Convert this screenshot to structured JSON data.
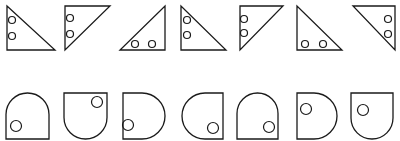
{
  "figure": {
    "stroke_color": "#1a1a1a",
    "background": "#ffffff"
  },
  "rows": [
    {
      "name": "triangles",
      "items": [
        {
          "points": "7,6 7,50 55,50",
          "circles": [
            [
              12,
              20
            ],
            [
              12,
              36
            ]
          ]
        },
        {
          "points": "65,6 110,6 65,50",
          "circles": [
            [
              70,
              18
            ],
            [
              70,
              34
            ]
          ]
        },
        {
          "points": "165,6 165,50 120,50",
          "circles": [
            [
              135,
              44
            ],
            [
              152,
              44
            ]
          ]
        },
        {
          "points": "181,6 181,50 226,50",
          "circles": [
            [
              187,
              20
            ],
            [
              187,
              35
            ]
          ]
        },
        {
          "points": "240,6 283,6 240,50",
          "circles": [
            [
              244,
              19
            ],
            [
              244,
              33
            ]
          ]
        },
        {
          "points": "297,6 297,50 342,50",
          "circles": [
            [
              305,
              44
            ],
            [
              323,
              44
            ]
          ]
        },
        {
          "points": "353,6 395,6 395,50",
          "circles": [
            [
              388,
              19
            ],
            [
              388,
              34
            ]
          ]
        }
      ],
      "circle_radius": 3.5
    },
    {
      "name": "d-shapes",
      "items": [
        {
          "orientation": "dome-top",
          "x": 6,
          "y": 93,
          "w": 43,
          "h": 46,
          "circle": [
            16,
            126
          ]
        },
        {
          "orientation": "dome-bottom",
          "x": 64,
          "y": 93,
          "w": 43,
          "h": 46,
          "circle": [
            97,
            102
          ]
        },
        {
          "orientation": "dome-right",
          "x": 123,
          "y": 93,
          "w": 42,
          "h": 46,
          "circle": [
            128,
            125
          ]
        },
        {
          "orientation": "dome-left",
          "x": 182,
          "y": 93,
          "w": 41,
          "h": 46,
          "circle": [
            213,
            128
          ]
        },
        {
          "orientation": "dome-top",
          "x": 237,
          "y": 93,
          "w": 41,
          "h": 46,
          "circle": [
            269,
            127
          ]
        },
        {
          "orientation": "dome-right",
          "x": 297,
          "y": 93,
          "w": 40,
          "h": 46,
          "circle": [
            306,
            109
          ]
        },
        {
          "orientation": "dome-bottom",
          "x": 351,
          "y": 93,
          "w": 42,
          "h": 46,
          "circle": [
            363,
            110
          ]
        }
      ],
      "circle_radius": 5.5
    }
  ]
}
